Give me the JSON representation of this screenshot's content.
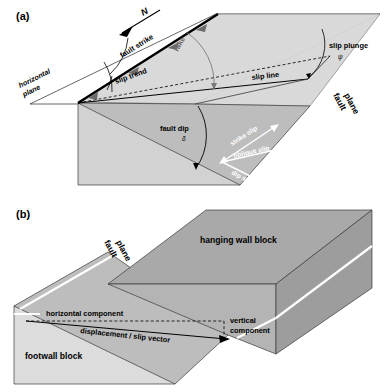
{
  "figure": {
    "panels": [
      {
        "key": "a",
        "label": "(a)",
        "labels": {
          "north": "N",
          "fault_strike": "fault strike",
          "slip_trend": "slip trend",
          "rake": "rake",
          "slip_plunge": "slip plunge",
          "slip_line": "slip line",
          "fault_plane_1": "fault",
          "fault_plane_2": "plane",
          "horizontal_plane_1": "horizontal",
          "horizontal_plane_2": "plane",
          "fault_dip": "fault dip",
          "dip_symbol": "δ",
          "plunge_symbol": "ψ",
          "rake_symbol": "λ",
          "strike_slip": "strike slip",
          "oblique_slip": "oblique slip",
          "dip_slip": "dip slip"
        }
      },
      {
        "key": "b",
        "label": "(b)",
        "labels": {
          "hanging_wall": "hanging wall block",
          "footwall": "footwall block",
          "fault_plane_1": "fault",
          "fault_plane_2": "plane",
          "horizontal_component": "horizontal component",
          "displacement": "displacement / slip vector",
          "vertical_component_1": "vertical",
          "vertical_component_2": "component"
        }
      }
    ]
  },
  "colors": {
    "background": "#ffffff",
    "line": "#000000",
    "face_light": "#d2d2d2",
    "face_mid": "#bdbdbd",
    "face_dark": "#a9a9a9",
    "face_darker": "#9d9d9d",
    "face_pale": "#dcdcdc",
    "arrow_white": "#ffffff",
    "gray_text": "#6a6a6a",
    "gray_arc": "#7a7a7a"
  }
}
